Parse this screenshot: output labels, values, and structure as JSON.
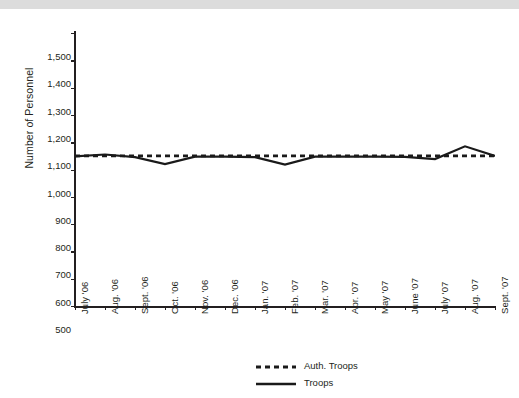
{
  "figure": {
    "background": "#ffffff",
    "top_band_color": "#dcdcdc",
    "axis_color": "#231f20"
  },
  "chart_data": {
    "type": "line",
    "title": "",
    "xlabel": "",
    "ylabel": "Number of Personnel",
    "ylim": [
      500,
      1500
    ],
    "ytick_step": 100,
    "yticks": [
      "500",
      "600",
      "700",
      "800",
      "900",
      "1,000",
      "1,100",
      "1,200",
      "1,300",
      "1,400",
      "1,500"
    ],
    "ytick_values": [
      500,
      600,
      700,
      800,
      900,
      1000,
      1100,
      1200,
      1300,
      1400,
      1500
    ],
    "grid": false,
    "legend_position": "bottom-center",
    "categories": [
      "July '06",
      "Aug. '06",
      "Sept. '06",
      "Oct. '06",
      "Nov. '06",
      "Dec. '06",
      "Jan. '07",
      "Feb. '07",
      "Mar. '07",
      "Apr. '07",
      "May '07",
      "June '07",
      "July '07",
      "Aug. '07",
      "Sept. '07"
    ],
    "series": [
      {
        "name": "Auth. Troops",
        "style": "dotted",
        "color": "#1a1a1a",
        "values": [
          1050,
          1050,
          1050,
          1050,
          1050,
          1050,
          1050,
          1050,
          1050,
          1050,
          1050,
          1050,
          1050,
          1050,
          1050
        ]
      },
      {
        "name": "Troops",
        "style": "solid",
        "color": "#1a1a1a",
        "values": [
          1048,
          1055,
          1045,
          1020,
          1047,
          1047,
          1045,
          1018,
          1047,
          1047,
          1047,
          1046,
          1038,
          1085,
          1050
        ]
      }
    ]
  },
  "legend": {
    "items": [
      {
        "label": "Auth. Troops",
        "style": "dotted"
      },
      {
        "label": "Troops",
        "style": "solid"
      }
    ]
  }
}
